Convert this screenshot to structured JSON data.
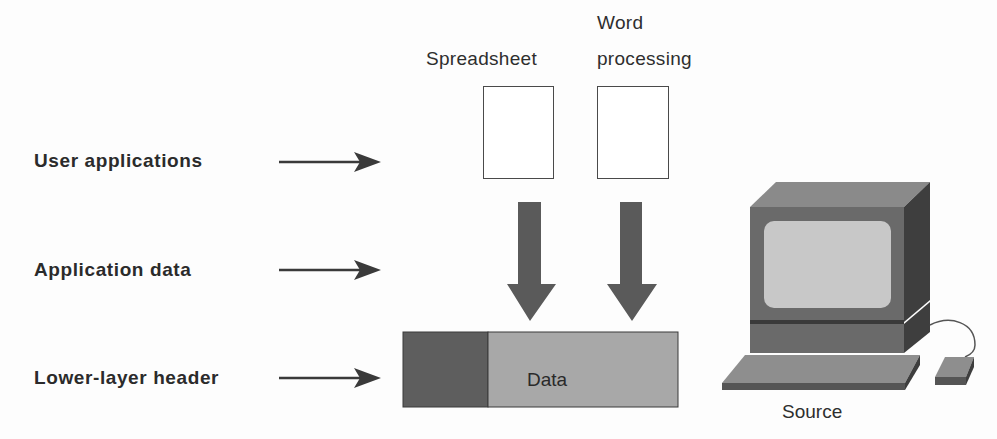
{
  "diagram": {
    "layers": [
      {
        "id": "user-applications",
        "label": "User applications"
      },
      {
        "id": "application-data",
        "label": "Application data"
      },
      {
        "id": "lower-layer-header",
        "label": "Lower-layer header"
      }
    ],
    "applications": [
      {
        "id": "spreadsheet",
        "label": "Spreadsheet"
      },
      {
        "id": "word-processing",
        "label_line1": "Word",
        "label_line2": "processing"
      }
    ],
    "packet": {
      "header_label": "",
      "data_label": "Data"
    },
    "computer": {
      "label": "Source"
    },
    "colors": {
      "arrow_dark": "#5a5a5a",
      "header_segment": "#5e5e5e",
      "data_segment": "#a8a8a8",
      "monitor_front": "#6a6a6a",
      "monitor_top": "#8a8a8a",
      "monitor_side": "#3e3e3e",
      "screen": "#c8c8c8",
      "keyboard_top": "#8e8e8e",
      "keyboard_front": "#555555"
    }
  }
}
